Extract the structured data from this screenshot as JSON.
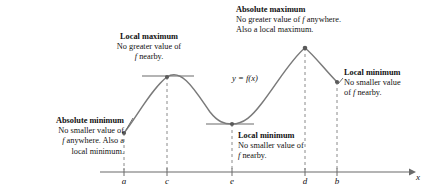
{
  "figure": {
    "title_implicit": "Extreme values of a function on a closed interval",
    "curve_label": "y = f(x)",
    "axis": {
      "x_label": "x",
      "tick_labels": [
        "a",
        "c",
        "e",
        "d",
        "b"
      ],
      "tick_positions_px": [
        124,
        167,
        232,
        305,
        337
      ],
      "axis_y_px": 172,
      "axis_start_px": 100,
      "axis_end_px": 414
    },
    "stroke_color": "#6b6b6b",
    "text_color": "#111111"
  },
  "annotations": [
    {
      "id": "absolute-minimum",
      "title": "Absolute minimum",
      "lines": [
        "No smaller value of",
        "f anywhere. Also a",
        "local minimum."
      ],
      "align": "right",
      "points_to": "a"
    },
    {
      "id": "local-maximum",
      "title": "Local maximum",
      "lines": [
        "No greater value of",
        "f nearby."
      ],
      "align": "center",
      "points_to": "c"
    },
    {
      "id": "absolute-maximum",
      "title": "Absolute maximum",
      "lines": [
        "No greater value of f anywhere.",
        "Also a local maximum."
      ],
      "align": "left",
      "points_to": "d"
    },
    {
      "id": "local-minimum-center",
      "title": "Local minimum",
      "lines": [
        "No smaller value of",
        "f nearby."
      ],
      "align": "left",
      "points_to": "e"
    },
    {
      "id": "local-minimum-right",
      "title": "Local minimum",
      "lines": [
        "No smaller value",
        "of f nearby."
      ],
      "align": "left",
      "points_to": "b"
    }
  ],
  "chart_data": {
    "type": "line",
    "title": "",
    "xlabel": "x",
    "ylabel": "",
    "curve_label": "y = f(x)",
    "grid": false,
    "legend": "none",
    "x_ticks": [
      "a",
      "c",
      "e",
      "d",
      "b"
    ],
    "x_tick_px": [
      124,
      167,
      232,
      305,
      337
    ],
    "critical_points": [
      {
        "x_label": "a",
        "x_px": 124,
        "y_px": 133,
        "kind": "absolute minimum (endpoint); also a local minimum"
      },
      {
        "x_label": "c",
        "x_px": 167,
        "y_px": 77,
        "kind": "local maximum"
      },
      {
        "x_label": "e",
        "x_px": 232,
        "y_px": 124,
        "kind": "local minimum"
      },
      {
        "x_label": "d",
        "x_px": 305,
        "y_px": 48,
        "kind": "absolute maximum; also a local maximum"
      },
      {
        "x_label": "b",
        "x_px": 337,
        "y_px": 82,
        "kind": "local minimum (endpoint)"
      }
    ],
    "horizontal_tangents_at": [
      "c",
      "e"
    ],
    "curve_path_px": "M124,133 C136,118 152,88 167,77 C182,67 196,92 210,112 C218,122 224,124 232,124 C244,124 252,116 262,103 C278,82 292,58 305,48 C314,55 325,70 337,82"
  }
}
